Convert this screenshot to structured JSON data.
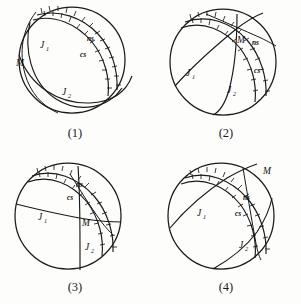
{
  "figure": {
    "panel_count": 4,
    "ink_color": "#1a1a1a",
    "background_color": "#fdfdfb"
  },
  "labels": {
    "joint1": "J",
    "joint1_sub": "1",
    "joint2": "J",
    "joint2_sub": "2",
    "master": "M",
    "normal_shear": "ns",
    "conjugate_shear": "cs"
  },
  "panels": [
    {
      "id": "panel-1",
      "caption": "(1)",
      "labels": {
        "j1": "J",
        "j1_sub": "1",
        "j2": "J",
        "j2_sub": "2",
        "m": "M",
        "ns": "ns",
        "cs": "cs"
      }
    },
    {
      "id": "panel-2",
      "caption": "(2)",
      "labels": {
        "j1": "J",
        "j1_sub": "1",
        "j2": "J",
        "j2_sub": "2",
        "m": "M",
        "ns": "ns",
        "cs": "cs"
      }
    },
    {
      "id": "panel-3",
      "caption": "(3)",
      "labels": {
        "j1": "J",
        "j1_sub": "1",
        "j2": "J",
        "j2_sub": "2",
        "m": "M",
        "ns": "ns",
        "cs": "cs"
      }
    },
    {
      "id": "panel-4",
      "caption": "(4)",
      "labels": {
        "j1": "J",
        "j1_sub": "1",
        "j2": "J",
        "j2_sub": "2",
        "m": "M",
        "ns": "ns",
        "cs": "cs"
      }
    }
  ],
  "bleed_through": {
    "row1": "■■■■ ■■■■■",
    "row2": "■■■■■■",
    "row3": "■■■■ ■■■■",
    "row4": "■■■■■"
  }
}
